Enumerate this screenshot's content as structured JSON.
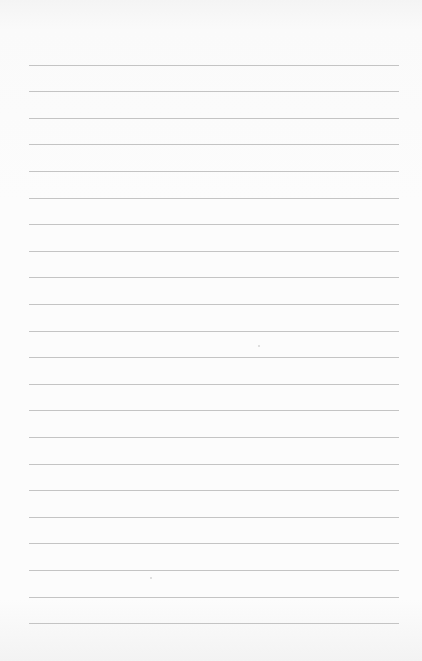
{
  "paper": {
    "type": "lined-paper",
    "line_count": 22,
    "first_line_y": 64.5,
    "line_spacing": 26.6,
    "line_left": 29,
    "line_width": 370,
    "line_color": "#c4c4c4",
    "background_color": "#fbfbfb"
  },
  "specks": [
    {
      "x": 258,
      "y": 345
    },
    {
      "x": 150,
      "y": 577
    }
  ]
}
